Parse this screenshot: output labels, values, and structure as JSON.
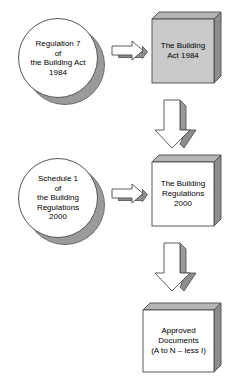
{
  "diagram": {
    "colors": {
      "shadow_gray": "#9a9a9a",
      "box_gray_fill": "#c9c9c9",
      "box_white_fill": "#ffffff",
      "outline": "#4a4a4a",
      "arrow_fill": "#ffffff",
      "arrow_shadow": "#8d8d8d",
      "text": "#000000",
      "background": "#ffffff"
    },
    "nodes": {
      "circle_regulation_7": {
        "shape": "circle",
        "lines": [
          "Regulation 7",
          "of",
          "the Building Act",
          "1984"
        ]
      },
      "circle_schedule_1": {
        "shape": "circle",
        "lines": [
          "Schedule 1",
          "of",
          "the Building",
          "Regulations",
          "2000"
        ]
      },
      "box_building_act": {
        "shape": "box-3d",
        "fill": "gray",
        "lines": [
          "The Building",
          "Act 1984"
        ]
      },
      "box_building_regulations": {
        "shape": "box-3d",
        "fill": "white",
        "lines": [
          "The Building",
          "Regulations",
          "2000"
        ]
      },
      "box_approved_documents": {
        "shape": "box-3d",
        "fill": "white",
        "lines": [
          "Approved",
          "Documents",
          "(A to N – less I)"
        ]
      }
    },
    "arrows": [
      {
        "name": "arrow-regulation7-to-act",
        "direction": "right"
      },
      {
        "name": "arrow-act-to-regulations",
        "direction": "down"
      },
      {
        "name": "arrow-schedule1-to-regulations",
        "direction": "right"
      },
      {
        "name": "arrow-regulations-to-approved-documents",
        "direction": "down"
      }
    ]
  }
}
